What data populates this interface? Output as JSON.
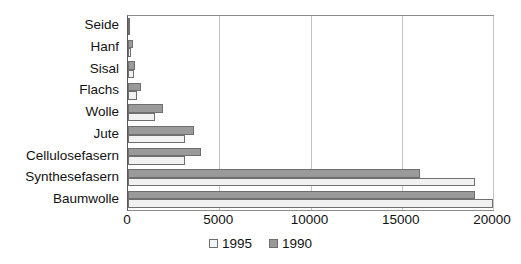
{
  "chart_data": {
    "type": "bar",
    "orientation": "horizontal",
    "title": "",
    "xlabel": "",
    "ylabel": "",
    "categories": [
      "Seide",
      "Hanf",
      "Sisal",
      "Flachs",
      "Wolle",
      "Jute",
      "Cellulosefasern",
      "Synthesefasern",
      "Baumwolle"
    ],
    "series": [
      {
        "name": "1995",
        "color": "#f1f1f1",
        "values": [
          75,
          150,
          350,
          500,
          1500,
          3100,
          3100,
          19000,
          20000
        ]
      },
      {
        "name": "1990",
        "color": "#9a9a9a",
        "values": [
          100,
          250,
          400,
          700,
          1900,
          3600,
          4000,
          16000,
          19000
        ]
      }
    ],
    "xlim": [
      0,
      20000
    ],
    "xticks": [
      0,
      5000,
      10000,
      15000,
      20000
    ],
    "xtick_labels": [
      "0",
      "5000",
      "10000",
      "15000",
      "20000"
    ],
    "grid": true,
    "grid_axis": "x",
    "legend_position": "bottom-center",
    "legend_entries": [
      "1995",
      "1990"
    ]
  }
}
